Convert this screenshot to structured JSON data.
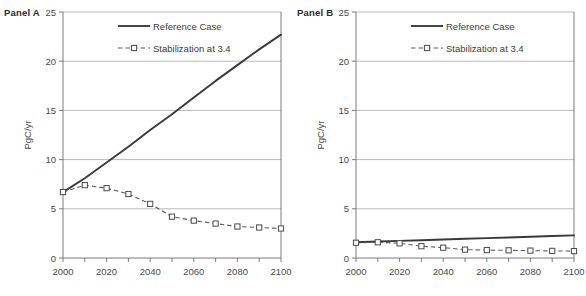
{
  "figure": {
    "background": "#ffffff",
    "gridline_color": "#a8a8a8",
    "reference_color": "#3a3a3a",
    "stabilization_color": "#5c5c5c"
  },
  "panels": [
    {
      "id": "a",
      "title": "Panel A",
      "ylabel": "PgC/yr",
      "legend": [
        {
          "label": "Reference Case",
          "style": "solid"
        },
        {
          "label": "Stabilization at 3.4",
          "style": "dashed-square"
        }
      ],
      "chart_data": {
        "type": "line",
        "title": "Panel A",
        "xlabel": "",
        "ylabel": "PgC/yr",
        "xlim": [
          2000,
          2100
        ],
        "ylim": [
          0,
          25
        ],
        "yticks": [
          0,
          5,
          10,
          15,
          20,
          25
        ],
        "xticks": [
          2000,
          2010,
          2020,
          2030,
          2040,
          2050,
          2060,
          2070,
          2080,
          2090,
          2100
        ],
        "xticklabels": [
          "2000",
          "",
          "2020",
          "",
          "2040",
          "",
          "2060",
          "",
          "2080",
          "",
          "2100"
        ],
        "grid": true,
        "legend_position": "top-center",
        "x": [
          2000,
          2010,
          2020,
          2030,
          2040,
          2050,
          2060,
          2070,
          2080,
          2090,
          2100
        ],
        "series": [
          {
            "name": "Reference Case",
            "markers": false,
            "values": [
              6.7,
              8.1,
              9.7,
              11.3,
              13.0,
              14.6,
              16.3,
              18.0,
              19.6,
              21.2,
              22.7
            ]
          },
          {
            "name": "Stabilization at 3.4",
            "markers": true,
            "values": [
              6.7,
              7.4,
              7.1,
              6.5,
              5.5,
              4.2,
              3.8,
              3.5,
              3.2,
              3.1,
              3.0
            ]
          }
        ]
      }
    },
    {
      "id": "b",
      "title": "Panel B",
      "ylabel": "PgC/yr",
      "legend": [
        {
          "label": "Reference Case",
          "style": "solid"
        },
        {
          "label": "Stabilization at 3.4",
          "style": "dashed-square"
        }
      ],
      "chart_data": {
        "type": "line",
        "title": "Panel B",
        "xlabel": "",
        "ylabel": "PgC/yr",
        "xlim": [
          2000,
          2100
        ],
        "ylim": [
          0,
          25
        ],
        "yticks": [
          0,
          5,
          10,
          15,
          20,
          25
        ],
        "xticks": [
          2000,
          2010,
          2020,
          2030,
          2040,
          2050,
          2060,
          2070,
          2080,
          2090,
          2100
        ],
        "xticklabels": [
          "2000",
          "",
          "2020",
          "",
          "2040",
          "",
          "2060",
          "",
          "2080",
          "",
          "2100"
        ],
        "grid": true,
        "legend_position": "top-center",
        "x": [
          2000,
          2010,
          2020,
          2030,
          2040,
          2050,
          2060,
          2070,
          2080,
          2090,
          2100
        ],
        "series": [
          {
            "name": "Reference Case",
            "markers": false,
            "values": [
              1.6,
              1.67,
              1.74,
              1.81,
              1.88,
              1.95,
              2.02,
              2.09,
              2.16,
              2.23,
              2.3
            ]
          },
          {
            "name": "Stabilization at 3.4",
            "markers": true,
            "values": [
              1.55,
              1.6,
              1.5,
              1.2,
              1.05,
              0.85,
              0.8,
              0.78,
              0.75,
              0.72,
              0.7
            ]
          }
        ]
      }
    }
  ]
}
